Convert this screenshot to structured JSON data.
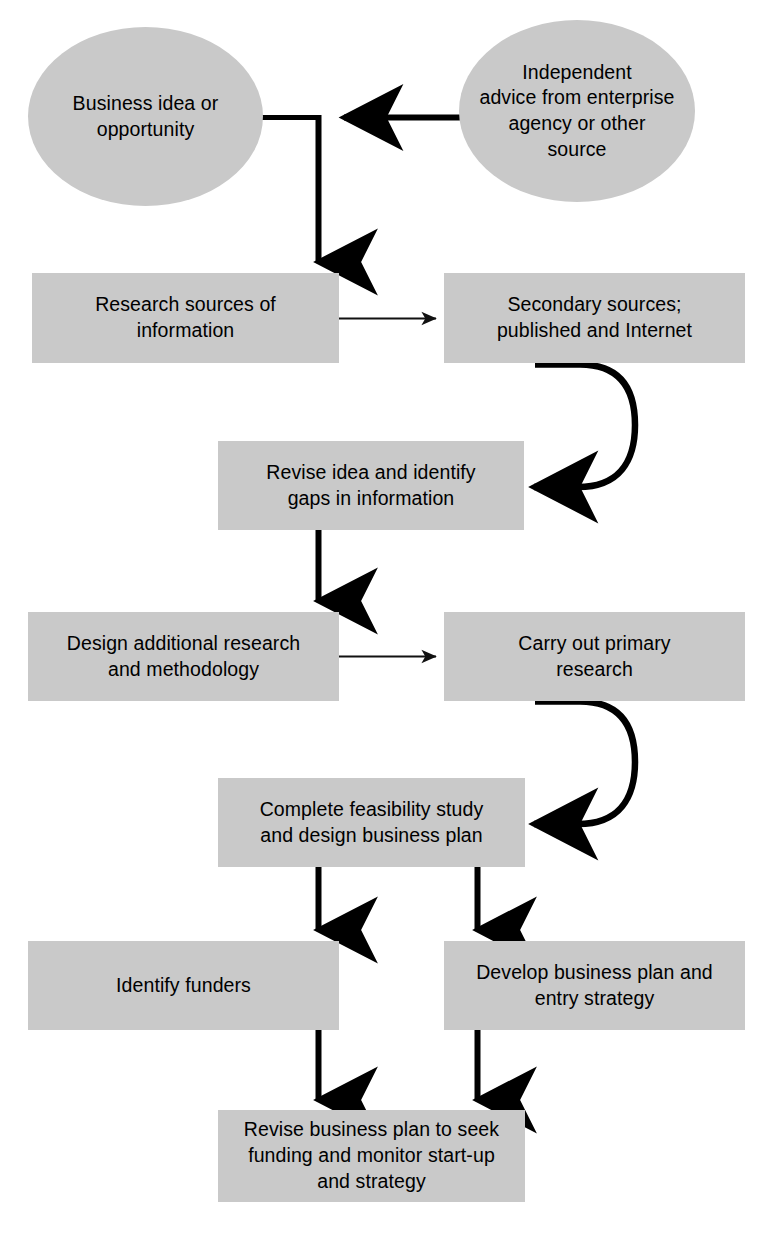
{
  "diagram": {
    "node_fill": "#c9c9c9",
    "connector_color": "#000000",
    "background": "#ffffff",
    "nodes": [
      {
        "id": "business-idea",
        "shape": "ellipse",
        "label": "Business idea or\nopportunity"
      },
      {
        "id": "independent-advice",
        "shape": "ellipse",
        "label": "Independent\nadvice from enterprise\nagency or other\nsource"
      },
      {
        "id": "research-sources",
        "shape": "rectangle",
        "label": "Research sources of\ninformation"
      },
      {
        "id": "secondary-sources",
        "shape": "rectangle",
        "label": "Secondary sources;\npublished and Internet"
      },
      {
        "id": "revise-idea",
        "shape": "rectangle",
        "label": "Revise idea and identify\ngaps in information"
      },
      {
        "id": "design-additional-research",
        "shape": "rectangle",
        "label": "Design additional research\nand methodology"
      },
      {
        "id": "carry-out-primary-research",
        "shape": "rectangle",
        "label": "Carry out primary\nresearch"
      },
      {
        "id": "complete-feasibility-study",
        "shape": "rectangle",
        "label": "Complete feasibility study\nand design business plan"
      },
      {
        "id": "identify-funders",
        "shape": "rectangle",
        "label": "Identify funders"
      },
      {
        "id": "develop-business-plan",
        "shape": "rectangle",
        "label": "Develop business plan and\nentry strategy"
      },
      {
        "id": "revise-business-plan",
        "shape": "rectangle",
        "label": "Revise business plan to seek\nfunding and monitor start-up\nand strategy"
      }
    ],
    "connectors": [
      {
        "id": "advice-to-idea",
        "from": "independent-advice",
        "to": "business-idea",
        "style": "thick",
        "direction": "left"
      },
      {
        "id": "idea-to-research-sources",
        "from": "business-idea",
        "to": "research-sources",
        "style": "thick",
        "direction": "down"
      },
      {
        "id": "research-to-secondary",
        "from": "research-sources",
        "to": "secondary-sources",
        "style": "thin",
        "direction": "right"
      },
      {
        "id": "secondary-to-revise-idea",
        "from": "secondary-sources",
        "to": "revise-idea",
        "style": "thick-curve",
        "direction": "left"
      },
      {
        "id": "revise-idea-to-design",
        "from": "revise-idea",
        "to": "design-additional-research",
        "style": "thick",
        "direction": "down"
      },
      {
        "id": "design-to-primary",
        "from": "design-additional-research",
        "to": "carry-out-primary-research",
        "style": "thin",
        "direction": "right"
      },
      {
        "id": "primary-to-feasibility",
        "from": "carry-out-primary-research",
        "to": "complete-feasibility-study",
        "style": "thick-curve",
        "direction": "left"
      },
      {
        "id": "feasibility-to-funders",
        "from": "complete-feasibility-study",
        "to": "identify-funders",
        "style": "thick",
        "direction": "down"
      },
      {
        "id": "feasibility-to-develop-plan",
        "from": "complete-feasibility-study",
        "to": "develop-business-plan",
        "style": "thick",
        "direction": "down"
      },
      {
        "id": "funders-to-revise-plan",
        "from": "identify-funders",
        "to": "revise-business-plan",
        "style": "thick",
        "direction": "down"
      },
      {
        "id": "develop-plan-to-revise-plan",
        "from": "develop-business-plan",
        "to": "revise-business-plan",
        "style": "thick",
        "direction": "down"
      }
    ]
  }
}
